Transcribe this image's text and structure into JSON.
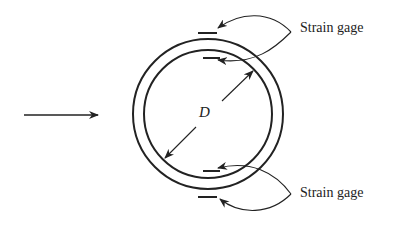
{
  "diagram": {
    "labels": {
      "top_gage": "Strain gage",
      "bottom_gage": "Strain gage",
      "diameter": "D"
    },
    "colors": {
      "line": "#222222",
      "background": "#ffffff"
    }
  }
}
